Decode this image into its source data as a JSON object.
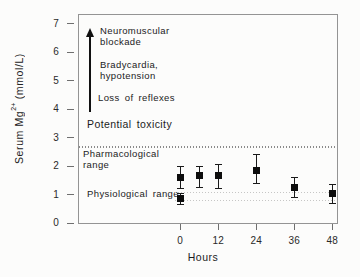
{
  "figure": {
    "background": "#fcfcfb",
    "plot_border_color": "#949494",
    "ink_color": "#1b1b1b",
    "marker_color": "#0d0d0d"
  },
  "chart_data": {
    "type": "scatter",
    "title": "",
    "xlabel": "Hours",
    "ylabel": {
      "prefix": "Serum  Mg",
      "sup": "2+",
      "suffix": " (mmol/L)"
    },
    "xlim": [
      -32,
      49.5
    ],
    "ylim": [
      0,
      7.3
    ],
    "grid": false,
    "legend": "none",
    "xticks": [
      {
        "value": 0,
        "label": "0"
      },
      {
        "value": 12,
        "label": "12"
      },
      {
        "value": 24,
        "label": "24"
      },
      {
        "value": 36,
        "label": "36"
      },
      {
        "value": 48,
        "label": "48"
      }
    ],
    "yticks": [
      {
        "value": 0,
        "label": "0"
      },
      {
        "value": 1,
        "label": "1"
      },
      {
        "value": 2,
        "label": "2"
      },
      {
        "value": 3,
        "label": "3"
      },
      {
        "value": 4,
        "label": "4"
      },
      {
        "value": 5,
        "label": "5"
      },
      {
        "value": 6,
        "label": "6"
      },
      {
        "value": 7,
        "label": "7"
      }
    ],
    "series": [
      {
        "name": "serum-mg-during-treatment",
        "marker": "filled-square",
        "points": [
          {
            "x": 0,
            "y": 1.6,
            "err_lo": 0.4,
            "err_hi": 0.4
          },
          {
            "x": 6,
            "y": 1.65,
            "err_lo": 0.4,
            "err_hi": 0.35
          },
          {
            "x": 12,
            "y": 1.65,
            "err_lo": 0.45,
            "err_hi": 0.4
          },
          {
            "x": 24,
            "y": 1.85,
            "err_lo": 0.45,
            "err_hi": 0.55
          },
          {
            "x": 36,
            "y": 1.25,
            "err_lo": 0.35,
            "err_hi": 0.35
          },
          {
            "x": 48,
            "y": 1.05,
            "err_lo": 0.35,
            "err_hi": 0.3
          }
        ]
      },
      {
        "name": "baseline-physiological",
        "marker": "filled-square",
        "points": [
          {
            "x": 0,
            "y": 0.85,
            "err_lo": 0.2,
            "err_hi": 0.2
          }
        ]
      }
    ],
    "reference_lines": [
      {
        "y": 2.65,
        "style": "dotted-dense",
        "extent": "full",
        "meaning": "upper limit of pharmacological range"
      },
      {
        "y": 1.05,
        "style": "dotted-faint",
        "extent": "right",
        "meaning": "upper limit of physiological range"
      },
      {
        "y": 0.78,
        "style": "dotted-faint",
        "extent": "right",
        "meaning": "lower limit of physiological range"
      }
    ],
    "annotations": {
      "neuromuscular": {
        "line1": "Neuromuscular",
        "line2": "blockade"
      },
      "bradycardia": {
        "line1": "Bradycardia,",
        "line2": "hypotension"
      },
      "loss": {
        "text": "Loss of reflexes"
      },
      "potential": {
        "text": "Potential toxicity"
      },
      "pharmacological": {
        "line1": "Pharmacological",
        "line2": "range"
      },
      "physiological": {
        "text": "Physiological range"
      }
    },
    "arrow": {
      "direction": "up",
      "meaning": "increasing toxicity with rising serum Mg2+"
    }
  }
}
